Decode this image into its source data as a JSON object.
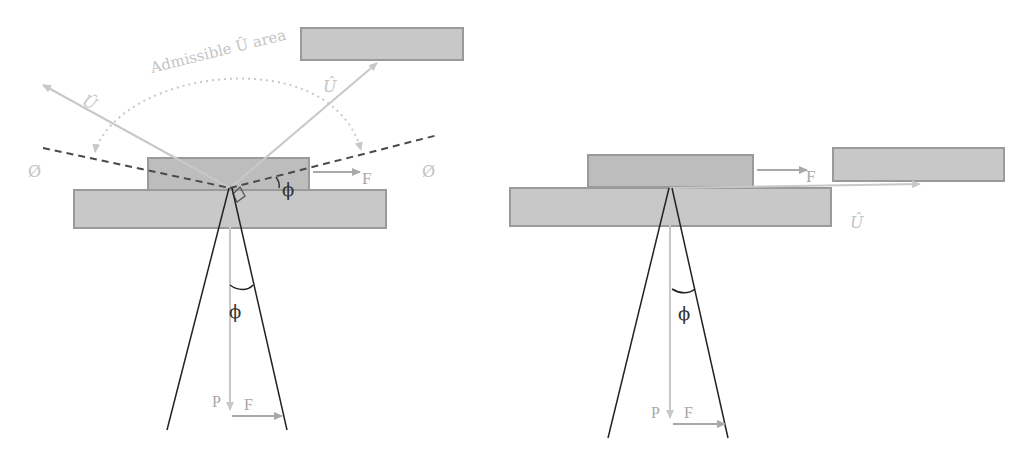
{
  "diagram": {
    "colors": {
      "block_fill": "#c8c8c8",
      "block_stroke": "#9a9a9a",
      "top_block_fill": "#bdbdbd",
      "arrow_light": "#c8c8c8",
      "arrow_grey": "#a9a9a9",
      "dashed_line": "#4a4a4a",
      "cone_line": "#222222",
      "text_light": "#c4c4c4",
      "text_grey": "#a8a8a8",
      "text_dark": "#333333"
    },
    "left_panel": {
      "arc_label": "Admissible Û area",
      "u_hat_left": "Û",
      "u_hat_right": "Û",
      "boundary_left": "Ø",
      "boundary_right": "Ø",
      "force_label_top": "F",
      "angle_label_top": "ϕ",
      "angle_label_cone": "ϕ",
      "normal_label": "P",
      "force_label_cone": "F"
    },
    "right_panel": {
      "force_label_top": "F",
      "u_hat": "Û",
      "angle_label_cone": "ϕ",
      "normal_label": "P",
      "force_label_cone": "F"
    }
  }
}
